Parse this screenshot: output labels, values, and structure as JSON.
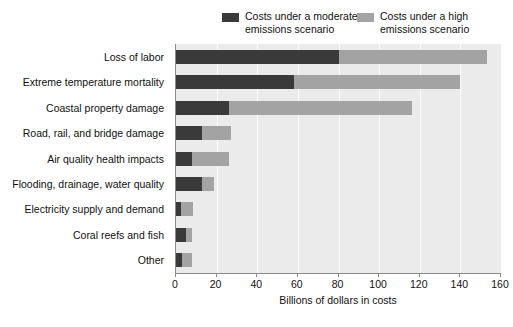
{
  "legend": {
    "entries": [
      {
        "label": "Costs under a moderate\nemissions scenario",
        "color": "#3a3a3a",
        "key": "moderate"
      },
      {
        "label": "Costs under a high\nemissions scenario",
        "color": "#a3a3a3",
        "key": "high"
      }
    ]
  },
  "axis": {
    "x_title": "Billions of dollars in costs",
    "ticks": [
      "0",
      "20",
      "40",
      "60",
      "80",
      "100",
      "120",
      "140",
      "160"
    ]
  },
  "chart_data": {
    "type": "bar",
    "orientation": "horizontal",
    "stacked": true,
    "title": "",
    "xlabel": "Billions of dollars in costs",
    "ylabel": "",
    "xlim": [
      0,
      160
    ],
    "xticks": [
      0,
      20,
      40,
      60,
      80,
      100,
      120,
      140,
      160
    ],
    "grid": true,
    "legend_position": "top",
    "categories": [
      "Loss of labor",
      "Extreme temperature mortality",
      "Coastal property damage",
      "Road, rail, and bridge damage",
      "Air quality health impacts",
      "Flooding, drainage, water quality",
      "Electricity supply and demand",
      "Coral reefs and fish",
      "Other"
    ],
    "series": [
      {
        "name": "Costs under a moderate emissions scenario",
        "color": "#3a3a3a",
        "values": [
          80,
          58,
          26,
          13,
          8,
          13,
          2.5,
          5,
          3
        ]
      },
      {
        "name": "Costs under a high emissions scenario",
        "color": "#a3a3a3",
        "values": [
          153,
          140,
          116,
          27,
          26,
          18.5,
          8.5,
          8,
          8
        ]
      }
    ]
  }
}
